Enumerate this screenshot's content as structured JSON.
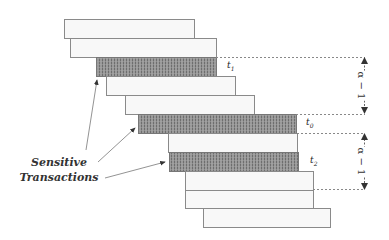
{
  "diagram": {
    "type": "staggered transaction timeline",
    "caption": {
      "line1": "Sensitive",
      "line2": "Transactions"
    },
    "transaction_labels": {
      "t1": "t",
      "t1_sub": "1",
      "t0": "t",
      "t0_sub": "0",
      "t2": "t",
      "t2_sub": "2"
    },
    "interval_labels": {
      "upper": "α − 1",
      "lower": "α − 1"
    },
    "colors": {
      "bar_fill": "#f7f7f7",
      "bar_stroke": "#8a8a8a",
      "sensitive_fill": "#8c8c8c",
      "arrow": "#666666",
      "dashed": "#888888"
    },
    "bars": [
      {
        "x": 64,
        "y": 19,
        "w": 130,
        "h": 19,
        "sensitive": false
      },
      {
        "x": 70,
        "y": 38,
        "w": 146,
        "h": 19,
        "sensitive": false
      },
      {
        "x": 96,
        "y": 57,
        "w": 120,
        "h": 19,
        "sensitive": true,
        "label": "t1"
      },
      {
        "x": 106,
        "y": 76,
        "w": 129,
        "h": 19,
        "sensitive": false
      },
      {
        "x": 125,
        "y": 95,
        "w": 129,
        "h": 19,
        "sensitive": false
      },
      {
        "x": 138,
        "y": 114,
        "w": 158,
        "h": 19,
        "sensitive": true,
        "label": "t0"
      },
      {
        "x": 168,
        "y": 133,
        "w": 129,
        "h": 19,
        "sensitive": false
      },
      {
        "x": 169,
        "y": 152,
        "w": 129,
        "h": 19,
        "sensitive": true,
        "label": "t2"
      },
      {
        "x": 185,
        "y": 171,
        "w": 128,
        "h": 19,
        "sensitive": false
      },
      {
        "x": 185,
        "y": 190,
        "w": 128,
        "h": 18,
        "sensitive": false
      },
      {
        "x": 203,
        "y": 208,
        "w": 127,
        "h": 19,
        "sensitive": false
      }
    ]
  }
}
